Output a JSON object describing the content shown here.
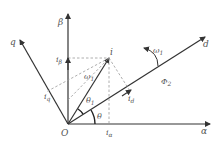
{
  "diagram": {
    "colors": {
      "axis": "#333333",
      "dashed": "#999999",
      "label": "#555555"
    },
    "labels": {
      "origin": "O",
      "alpha": "α",
      "beta": "β",
      "d": "d",
      "q": "q",
      "i": "i",
      "i_alpha": "i",
      "i_alpha_sub": "α",
      "i_beta": "i",
      "i_beta_sub": "β",
      "i_d": "i",
      "i_d_sub": "d",
      "i_q": "i",
      "i_q_sub": "q",
      "omega1_inner": "ω",
      "omega1_inner_sub": "1",
      "omega1_rot": "ω",
      "omega1_rot_sub": "1",
      "theta": "θ",
      "theta1": "θ",
      "theta1_sub": "1",
      "phi2": "Φ",
      "phi2_sub": "2"
    }
  }
}
